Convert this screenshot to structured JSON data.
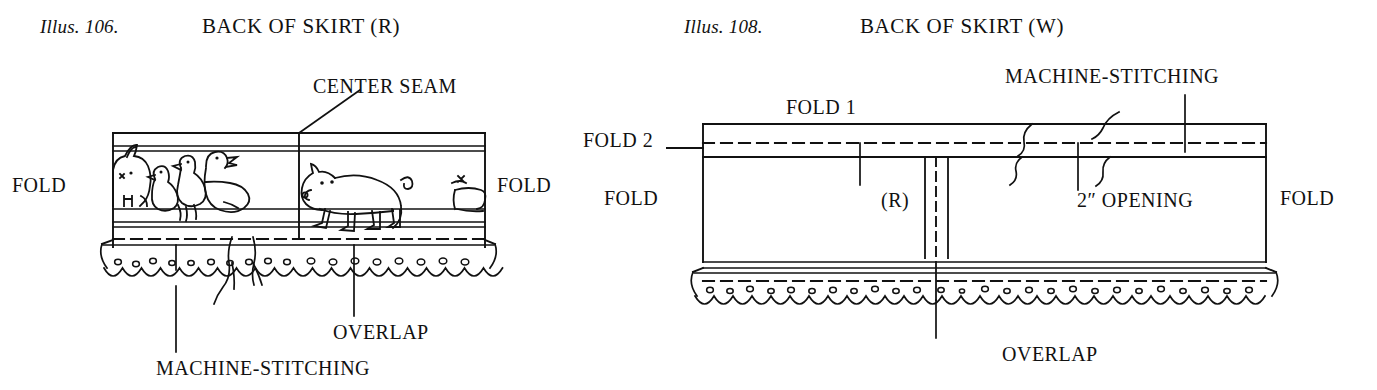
{
  "figures": [
    {
      "id": "illus-106",
      "caption": "Illus. 106.",
      "title": "BACK OF SKIRT (R)",
      "labels": {
        "center_seam": "CENTER SEAM",
        "fold_left": "FOLD",
        "fold_right": "FOLD",
        "machine_stitching": "MACHINE-STITCHING",
        "overlap": "OVERLAP"
      },
      "motifs": [
        "rabbit",
        "duck",
        "duck",
        "goose",
        "pig",
        "pig-partial"
      ]
    },
    {
      "id": "illus-108",
      "caption": "Illus. 108.",
      "title": "BACK OF SKIRT (W)",
      "labels": {
        "fold_1": "FOLD 1",
        "fold_2": "FOLD 2",
        "fold_left": "FOLD",
        "fold_right": "FOLD",
        "right_side": "(R)",
        "opening": "2″ OPENING",
        "machine_stitching": "MACHINE-STITCHING",
        "overlap": "OVERLAP"
      }
    }
  ],
  "colors": {
    "ink": "#111111",
    "paper": "#ffffff"
  }
}
